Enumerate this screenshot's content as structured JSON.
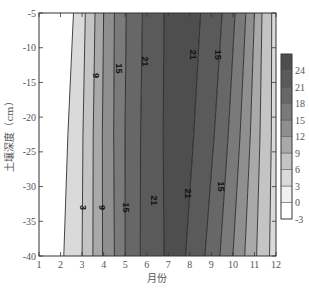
{
  "chart_data": {
    "type": "contour",
    "title": "",
    "xlabel": "月份",
    "ylabel": "土壤深度（cm）",
    "x_ticks": [
      1,
      2,
      3,
      4,
      5,
      6,
      7,
      8,
      9,
      10,
      11,
      12
    ],
    "y_ticks": [
      -5,
      -10,
      -15,
      -20,
      -25,
      -30,
      -35,
      -40
    ],
    "xlim": [
      1,
      12
    ],
    "ylim": [
      -40,
      -5
    ],
    "grid": false,
    "colorbar": {
      "position": "right",
      "levels": [
        -3,
        0,
        3,
        6,
        9,
        12,
        15,
        18,
        21,
        24
      ],
      "tick_labels": [
        "24",
        "21",
        "18",
        "15",
        "12",
        "9",
        "6",
        "3",
        "0",
        "-3"
      ],
      "colors": [
        "#ffffff",
        "#f0f0f0",
        "#dadada",
        "#c4c4c4",
        "#a9a9a9",
        "#8f8f8f",
        "#7a7a7a",
        "#676767",
        "#5a5a5a",
        "#4e4e4e"
      ]
    },
    "contour_labels": [
      {
        "text": "9",
        "month": 3.6,
        "depth": -14
      },
      {
        "text": "15",
        "month": 4.7,
        "depth": -13
      },
      {
        "text": "21",
        "month": 5.9,
        "depth": -12
      },
      {
        "text": "21",
        "month": 8.1,
        "depth": -11
      },
      {
        "text": "15",
        "month": 9.3,
        "depth": -11
      },
      {
        "text": "3",
        "month": 3.0,
        "depth": -33
      },
      {
        "text": "9",
        "month": 3.9,
        "depth": -33
      },
      {
        "text": "15",
        "month": 5.0,
        "depth": -33
      },
      {
        "text": "21",
        "month": 6.3,
        "depth": -32
      },
      {
        "text": "21",
        "month": 7.9,
        "depth": -31
      },
      {
        "text": "15",
        "month": 9.4,
        "depth": -30
      }
    ],
    "contours": [
      {
        "level": 0,
        "top_month": 2.6,
        "bottom_month": 2.15
      },
      {
        "level": 3,
        "top_month": 3.15,
        "bottom_month": 3.0
      },
      {
        "level": 6,
        "top_month": 3.6,
        "bottom_month": 3.5
      },
      {
        "level": 9,
        "top_month": 4.0,
        "bottom_month": 3.95
      },
      {
        "level": 12,
        "top_month": 4.5,
        "bottom_month": 4.5
      },
      {
        "level": 15,
        "top_month": 5.05,
        "bottom_month": 5.0
      },
      {
        "level": 18,
        "top_month": 5.8,
        "bottom_month": 5.7
      },
      {
        "level": 21,
        "top_month": 6.8,
        "bottom_month": 6.8
      },
      {
        "level": 21,
        "top_month": 8.5,
        "bottom_month": 7.8
      },
      {
        "level": 18,
        "top_month": 9.5,
        "bottom_month": 8.7
      },
      {
        "level": 15,
        "top_month": 10.1,
        "bottom_month": 9.4
      },
      {
        "level": 12,
        "top_month": 10.6,
        "bottom_month": 10.0
      },
      {
        "level": 9,
        "top_month": 11.0,
        "bottom_month": 10.55
      },
      {
        "level": 6,
        "top_month": 11.35,
        "bottom_month": 11.1
      },
      {
        "level": 3,
        "top_month": 11.8,
        "bottom_month": 11.7
      }
    ]
  }
}
